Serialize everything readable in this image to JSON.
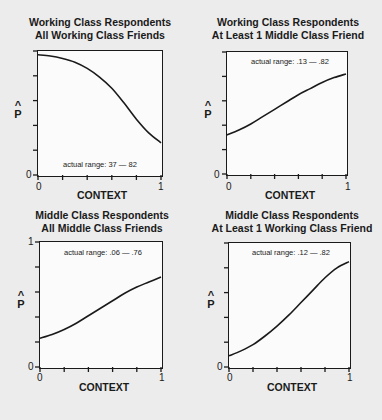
{
  "panels": [
    {
      "title_line1": "Working Class Respondents",
      "title_line2": "All Working Class Friends",
      "actual_range": "actual range: 37 — 82",
      "xlabel": "CONTEXT",
      "ylabel_hat": "^",
      "ylabel": "P",
      "x_tick_min": "0",
      "x_tick_max": "1",
      "y_tick_min": "0",
      "y_tick_max": ""
    },
    {
      "title_line1": "Working Class Respondents",
      "title_line2": "At Least 1 Middle Class Friend",
      "actual_range": "actual range: .13 — .82",
      "xlabel": "CONTEXT",
      "ylabel_hat": "^",
      "ylabel": "P",
      "x_tick_min": "0",
      "x_tick_max": "1",
      "y_tick_min": "0",
      "y_tick_max": ""
    },
    {
      "title_line1": "Middle Class Respondents",
      "title_line2": "All Middle Class Friends",
      "actual_range": "actual range: .06 — .76",
      "xlabel": "CONTEXT",
      "ylabel_hat": "^",
      "ylabel": "P",
      "x_tick_min": "0",
      "x_tick_max": "1",
      "y_tick_min": "0",
      "y_tick_max": "1"
    },
    {
      "title_line1": "Middle Class Respondents",
      "title_line2": "At Least 1 Working Class Friend",
      "actual_range": "actual range: .12 — .82",
      "xlabel": "CONTEXT",
      "ylabel_hat": "^",
      "ylabel": "P",
      "x_tick_min": "0",
      "x_tick_max": "1",
      "y_tick_min": "0",
      "y_tick_max": ""
    }
  ],
  "chart_data": [
    {
      "type": "line",
      "title": "Working Class Respondents / All Working Class Friends",
      "xlabel": "CONTEXT",
      "ylabel": "P-hat",
      "xlim": [
        0,
        1
      ],
      "ylim": [
        0,
        1
      ],
      "x_ticks": [
        0,
        0.2,
        0.4,
        0.6,
        0.8,
        1
      ],
      "y_ticks": [
        0,
        0.2,
        0.4,
        0.6,
        0.8,
        1
      ],
      "annotation": "actual range: 37 — 82",
      "x": [
        0,
        0.1,
        0.2,
        0.3,
        0.4,
        0.5,
        0.6,
        0.7,
        0.8,
        0.9,
        1.0
      ],
      "y": [
        0.97,
        0.96,
        0.94,
        0.91,
        0.86,
        0.79,
        0.7,
        0.58,
        0.45,
        0.34,
        0.26
      ]
    },
    {
      "type": "line",
      "title": "Working Class Respondents / At Least 1 Middle Class Friend",
      "xlabel": "CONTEXT",
      "ylabel": "P-hat",
      "xlim": [
        0,
        1
      ],
      "ylim": [
        0,
        1
      ],
      "x_ticks": [
        0,
        0.2,
        0.4,
        0.6,
        0.8,
        1
      ],
      "y_ticks": [
        0,
        0.2,
        0.4,
        0.6,
        0.8,
        1
      ],
      "annotation": "actual range: .13 — .82",
      "x": [
        0,
        0.1,
        0.2,
        0.3,
        0.4,
        0.5,
        0.6,
        0.7,
        0.8,
        0.9,
        1.0
      ],
      "y": [
        0.32,
        0.36,
        0.41,
        0.47,
        0.53,
        0.59,
        0.65,
        0.7,
        0.75,
        0.79,
        0.82
      ]
    },
    {
      "type": "line",
      "title": "Middle Class Respondents / All Middle Class Friends",
      "xlabel": "CONTEXT",
      "ylabel": "P-hat",
      "xlim": [
        0,
        1
      ],
      "ylim": [
        0,
        1
      ],
      "x_ticks": [
        0,
        0.2,
        0.4,
        0.6,
        0.8,
        1
      ],
      "y_ticks": [
        0,
        0.2,
        0.4,
        0.6,
        0.8,
        1
      ],
      "annotation": "actual range: .06 — .76",
      "x": [
        0,
        0.1,
        0.2,
        0.3,
        0.4,
        0.5,
        0.6,
        0.7,
        0.8,
        0.9,
        1.0
      ],
      "y": [
        0.23,
        0.26,
        0.3,
        0.35,
        0.41,
        0.47,
        0.53,
        0.59,
        0.64,
        0.68,
        0.72
      ]
    },
    {
      "type": "line",
      "title": "Middle Class Respondents / At Least 1 Working Class Friend",
      "xlabel": "CONTEXT",
      "ylabel": "P-hat",
      "xlim": [
        0,
        1
      ],
      "ylim": [
        0,
        1
      ],
      "x_ticks": [
        0,
        0.2,
        0.4,
        0.6,
        0.8,
        1
      ],
      "y_ticks": [
        0,
        0.2,
        0.4,
        0.6,
        0.8,
        1
      ],
      "annotation": "actual range: .12 — .82",
      "x": [
        0,
        0.1,
        0.2,
        0.3,
        0.4,
        0.5,
        0.6,
        0.7,
        0.8,
        0.9,
        1.0
      ],
      "y": [
        0.09,
        0.13,
        0.18,
        0.25,
        0.33,
        0.42,
        0.52,
        0.62,
        0.72,
        0.8,
        0.85
      ]
    }
  ]
}
